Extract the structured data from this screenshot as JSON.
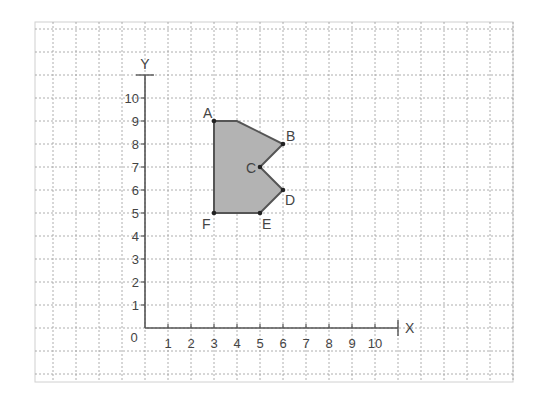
{
  "diagram": {
    "type": "coordinate-grid-polygon",
    "grid": {
      "origin_px": [
        145,
        328
      ],
      "unit_px": 23,
      "frame": {
        "x0": 35,
        "y0": 22,
        "x1": 513,
        "y1": 382
      },
      "cols_left_of_origin": 4,
      "cols_right_of_origin": 16,
      "rows_above_origin": 13,
      "rows_below_origin": 2,
      "line_color": "#9a9a9a",
      "frame_color": "#d0d0d0"
    },
    "axes": {
      "x_label": "X",
      "y_label": "Y",
      "origin_label": "0",
      "x_ticks": [
        "1",
        "2",
        "3",
        "4",
        "5",
        "6",
        "7",
        "8",
        "9",
        "10"
      ],
      "y_ticks": [
        "1",
        "2",
        "3",
        "4",
        "5",
        "6",
        "7",
        "8",
        "9",
        "10"
      ],
      "x_max": 11,
      "y_max": 11,
      "axis_color": "#555555"
    },
    "polygon": {
      "fill": "#b3b3b3",
      "stroke": "#555555",
      "vertices": [
        [
          3,
          9
        ],
        [
          4,
          9
        ],
        [
          6,
          8
        ],
        [
          5,
          7
        ],
        [
          6,
          6
        ],
        [
          5,
          5
        ],
        [
          3,
          5
        ]
      ]
    },
    "points": [
      {
        "label": "A",
        "x": 3,
        "y": 9,
        "label_dx": -11,
        "label_dy": -3
      },
      {
        "label": "B",
        "x": 6,
        "y": 8,
        "label_dx": 3,
        "label_dy": -3
      },
      {
        "label": "C",
        "x": 5,
        "y": 7,
        "label_dx": -14,
        "label_dy": 6
      },
      {
        "label": "D",
        "x": 6,
        "y": 6,
        "label_dx": 2,
        "label_dy": 15
      },
      {
        "label": "E",
        "x": 5,
        "y": 5,
        "label_dx": 2,
        "label_dy": 16
      },
      {
        "label": "F",
        "x": 3,
        "y": 5,
        "label_dx": -12,
        "label_dy": 16
      }
    ]
  }
}
